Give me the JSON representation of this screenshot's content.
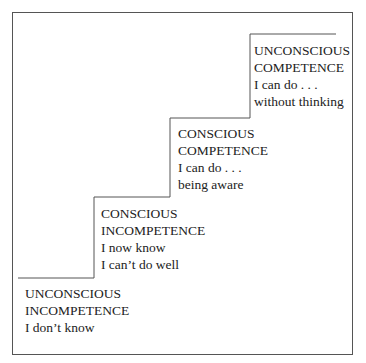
{
  "diagram": {
    "type": "staircase",
    "stages": [
      {
        "title_line1": "UNCONSCIOUS",
        "title_line2": "INCOMPETENCE",
        "desc_line1": "I don’t know",
        "desc_line2": ""
      },
      {
        "title_line1": "CONSCIOUS",
        "title_line2": "INCOMPETENCE",
        "desc_line1": "I now know",
        "desc_line2": "I can’t do well"
      },
      {
        "title_line1": "CONSCIOUS",
        "title_line2": "COMPETENCE",
        "desc_line1": "I can do . . .",
        "desc_line2": "being aware"
      },
      {
        "title_line1": "UNCONSCIOUS",
        "title_line2": "COMPETENCE",
        "desc_line1": "I can do . . .",
        "desc_line2": "without thinking"
      }
    ]
  }
}
